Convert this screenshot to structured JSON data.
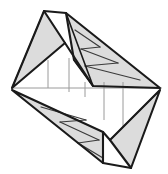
{
  "figure": {
    "canvas": {
      "width": 168,
      "height": 174
    },
    "colors": {
      "background": "#ffffff",
      "face_fill": "#dcdcdc",
      "face_fill_light": "#e4e4e4",
      "outline_stroke": "#1a1a1a",
      "crease_stroke": "#3a3a3a",
      "axis_stroke": "#9a9a9a",
      "tick_stroke": "#9a9a9a"
    },
    "strokes": {
      "outline_width": 2.1,
      "crease_width": 1.2,
      "axis_width": 1.0,
      "tick_width": 1.0
    },
    "vertices": {
      "top_left_apex": [
        44,
        11
      ],
      "top_right_apex": [
        66,
        13
      ],
      "left_point": [
        12,
        88
      ],
      "right_point": [
        160,
        88
      ],
      "upper_mid_notch": [
        65,
        43
      ],
      "upper_right_base": [
        154,
        85
      ],
      "lower_mid_notch": [
        103,
        132
      ],
      "lower_left_bottom": [
        103,
        163
      ],
      "bottom_right_apex": [
        131,
        168
      ],
      "lower_right_inner": [
        110,
        140
      ]
    },
    "faces": [
      {
        "name": "upper-left-triangle",
        "points": "44,11 65,43 12,88",
        "fill": "#dcdcdc"
      },
      {
        "name": "upper-right-band",
        "points": "66,13 160,88 93,86 74,60",
        "fill": "#dcdcdc"
      },
      {
        "name": "lower-left-band",
        "points": "12,90 103,132 103,163",
        "fill": "#dcdcdc"
      },
      {
        "name": "lower-right-triangle",
        "points": "160,90 131,168 110,140",
        "fill": "#dcdcdc"
      }
    ],
    "outline_paths": [
      {
        "name": "upper-left-outline",
        "d": "M 44 11 L 65 43 L 12 88 Z"
      },
      {
        "name": "upper-right-outline",
        "d": "M 66 13 L 160 88 L 93 86 L 74 60 Z"
      },
      {
        "name": "top-notch-edge",
        "d": "M 44 11 L 66 13"
      },
      {
        "name": "upper-left-spine",
        "d": "M 65 43 L 93 86"
      },
      {
        "name": "left-vertex-join",
        "d": "M 12 88 L 160 88"
      },
      {
        "name": "lower-left-outline",
        "d": "M 12 90 L 103 163 L 103 132 Z"
      },
      {
        "name": "lower-right-outline",
        "d": "M 160 90 L 131 168 L 110 140 Z"
      },
      {
        "name": "bottom-notch-edge",
        "d": "M 103 163 L 131 168"
      },
      {
        "name": "lower-right-spine",
        "d": "M 110 140 L 103 132"
      }
    ],
    "crease_paths": [
      {
        "name": "crease-ul-1",
        "d": "M 44 11 L 12 88"
      },
      {
        "name": "crease-ur-zig-1",
        "d": "M 75 30 L 100 47"
      },
      {
        "name": "crease-ur-zig-2",
        "d": "M 100 47 L 81 49"
      },
      {
        "name": "crease-ur-zig-3",
        "d": "M 81 49 L 118 63"
      },
      {
        "name": "crease-ur-zig-4",
        "d": "M 118 63 L 85 66"
      },
      {
        "name": "crease-ur-zig-5",
        "d": "M 85 66 L 140 80"
      },
      {
        "name": "crease-ur-edge",
        "d": "M 74 60 L 93 86"
      },
      {
        "name": "crease-ll-zig-1",
        "d": "M 41 107 L 86 120"
      },
      {
        "name": "crease-ll-zig-2",
        "d": "M 86 120 L 60 122"
      },
      {
        "name": "crease-ll-zig-3",
        "d": "M 60 122 L 99 140"
      },
      {
        "name": "crease-ll-zig-4",
        "d": "M 99 140 L 78 143"
      },
      {
        "name": "crease-ll-zig-5",
        "d": "M 78 143 L 103 158"
      },
      {
        "name": "crease-lr-1",
        "d": "M 160 90 L 110 140"
      },
      {
        "name": "crease-notch-vertical",
        "d": "M 66 13 L 93 86"
      }
    ],
    "axis": {
      "name": "horizontal-axis",
      "x1": 12,
      "y1": 88,
      "x2": 162,
      "y2": 88
    },
    "ticks": [
      {
        "name": "tick-1",
        "x": 48,
        "y1": 60,
        "y2": 88,
        "direction": "up"
      },
      {
        "name": "tick-2",
        "x": 69,
        "y1": 58,
        "y2": 92,
        "direction": "up"
      },
      {
        "name": "tick-3",
        "x": 85,
        "y1": 82,
        "y2": 97,
        "direction": "down"
      },
      {
        "name": "tick-4",
        "x": 104,
        "y1": 82,
        "y2": 120,
        "direction": "down"
      },
      {
        "name": "tick-5",
        "x": 123,
        "y1": 82,
        "y2": 126,
        "direction": "down"
      }
    ]
  }
}
